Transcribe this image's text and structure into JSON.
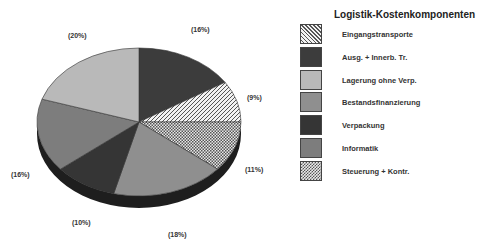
{
  "chart_data": {
    "type": "pie",
    "title": "Logistik-Kostenkomponenten",
    "style": "3d-pie, grayscale with hatch patterns",
    "start_angle": "12 o'clock, clockwise",
    "slices": [
      {
        "label": "Ausg. + Innerb. Tr.",
        "value": 16,
        "display": "(16%)"
      },
      {
        "label": "Eingangstransporte",
        "value": 9,
        "display": "(9%)"
      },
      {
        "label": "Steuerung + Kontr.",
        "value": 11,
        "display": "(11%)"
      },
      {
        "label": "Bestandsfinanzierung",
        "value": 18,
        "display": "(18%)"
      },
      {
        "label": "Verpackung",
        "value": 10,
        "display": "(10%)"
      },
      {
        "label": "Informatik",
        "value": 16,
        "display": "(16%)"
      },
      {
        "label": "Lagerung ohne Verp.",
        "value": 20,
        "display": "(20%)"
      }
    ],
    "legend": {
      "position": "right",
      "entries": [
        "Eingangstransporte",
        "Ausg. + Innerb. Tr.",
        "Lagerung ohne Verp.",
        "Bestandsfinanzierung",
        "Verpackung",
        "Informatik",
        "Steuerung + Kontr."
      ]
    }
  },
  "labels": {
    "l16a": "(16%)",
    "l9": "(9%)",
    "l11": "(11%)",
    "l18": "(18%)",
    "l10": "(10%)",
    "l16b": "(16%)",
    "l20": "(20%)"
  },
  "legend": {
    "title": "Logistik-Kostenkomponenten",
    "items": [
      {
        "label": "Eingangstransporte"
      },
      {
        "label": "Ausg. + Innerb. Tr."
      },
      {
        "label": "Lagerung ohne Verp."
      },
      {
        "label": "Bestandsfinanzierung"
      },
      {
        "label": "Verpackung"
      },
      {
        "label": "Informatik"
      },
      {
        "label": "Steuerung + Kontr."
      }
    ]
  }
}
